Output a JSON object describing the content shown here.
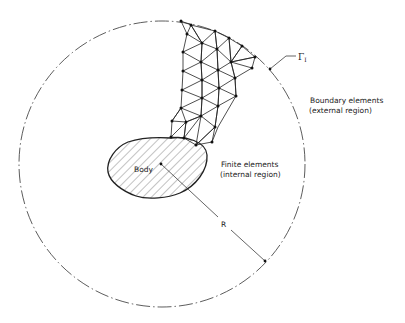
{
  "diagram": {
    "type": "FEM-BEM coupling schematic",
    "labels": {
      "body": "Body",
      "finite_elements_line1": "Finite elements",
      "finite_elements_line2": "(internal region)",
      "boundary_elements_line1": "Boundary elements",
      "boundary_elements_line2": "(external region)",
      "radius": "R",
      "interface_symbol": "Γ",
      "interface_subscript": "I"
    },
    "outer_circle": {
      "cx": 162,
      "cy": 164,
      "r": 143,
      "style": "dash-dot"
    },
    "colors": {
      "line": "#222222",
      "background": "#ffffff"
    }
  }
}
